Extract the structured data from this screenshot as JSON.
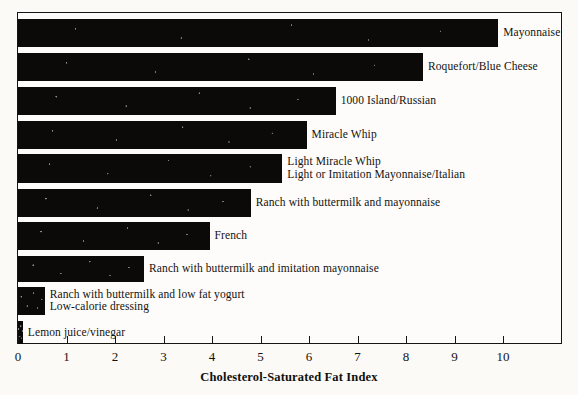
{
  "chart_data": {
    "type": "bar",
    "orientation": "horizontal",
    "title": "",
    "xlabel": "Cholesterol-Saturated Fat Index",
    "ylabel": "",
    "xlim": [
      0,
      11.2
    ],
    "grid": false,
    "legend": null,
    "tick_labels": [
      "0",
      "1",
      "2",
      "3",
      "4",
      "5",
      "6",
      "7",
      "8",
      "9",
      "10"
    ],
    "tick_values": [
      0,
      1,
      2,
      3,
      4,
      5,
      6,
      7,
      8,
      9,
      10
    ],
    "categories": [
      "Mayonnaise",
      "Roquefort/Blue Cheese",
      "1000 Island/Russian",
      "Miracle Whip",
      "Light Miracle Whip\nLight or Imitation Mayonnaise/Italian",
      "Ranch with buttermilk and mayonnaise",
      "French",
      "Ranch with buttermilk and imitation mayonnaise",
      "Ranch with buttermilk and low fat yogurt\nLow-calorie dressing",
      "Lemon juice/vinegar"
    ],
    "values": [
      9.9,
      8.35,
      6.55,
      5.95,
      5.45,
      4.8,
      3.95,
      2.6,
      0.55,
      0.1
    ],
    "bars": [
      {
        "label": "Mayonnaise",
        "label_lines": [
          "Mayonnaise"
        ],
        "value": 9.9,
        "top": 6,
        "height": 28
      },
      {
        "label": "Roquefort/Blue Cheese",
        "label_lines": [
          "Roquefort/Blue Cheese"
        ],
        "value": 8.35,
        "top": 40,
        "height": 28
      },
      {
        "label": "1000 Island/Russian",
        "label_lines": [
          "1000 Island/Russian"
        ],
        "value": 6.55,
        "top": 74,
        "height": 28
      },
      {
        "label": "Miracle Whip",
        "label_lines": [
          "Miracle Whip"
        ],
        "value": 5.95,
        "top": 108,
        "height": 28
      },
      {
        "label": "Light Miracle Whip / Light or Imitation Mayonnaise/Italian",
        "label_lines": [
          "Light Miracle Whip",
          "Light or Imitation Mayonnaise/Italian"
        ],
        "value": 5.45,
        "top": 141,
        "height": 29
      },
      {
        "label": "Ranch with buttermilk and mayonnaise",
        "label_lines": [
          "Ranch with buttermilk and mayonnaise"
        ],
        "value": 4.8,
        "top": 176,
        "height": 28
      },
      {
        "label": "French",
        "label_lines": [
          "French"
        ],
        "value": 3.95,
        "top": 209,
        "height": 28
      },
      {
        "label": "Ranch with buttermilk and imitation mayonnaise",
        "label_lines": [
          "Ranch with buttermilk and imitation mayonnaise"
        ],
        "value": 2.6,
        "top": 243,
        "height": 26
      },
      {
        "label": "Ranch with buttermilk and low fat yogurt / Low-calorie dressing",
        "label_lines": [
          "Ranch with buttermilk and low fat yogurt",
          "Low-calorie dressing"
        ],
        "value": 0.55,
        "top": 274,
        "height": 28
      },
      {
        "label": "Lemon juice/vinegar",
        "label_lines": [
          "Lemon juice/vinegar"
        ],
        "value": 0.1,
        "top": 308,
        "height": 23
      }
    ]
  },
  "colors": {
    "bar": "#0b0a08",
    "axis": "#17150f",
    "text": "#141210",
    "background": "#fbfaf7"
  }
}
